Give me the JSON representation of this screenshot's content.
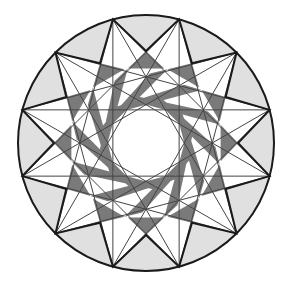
{
  "figure": {
    "center": [
      146,
      143
    ],
    "outer_radius": 128,
    "valley_radius": 92,
    "points": 12,
    "start_angle_deg": 15,
    "chord_steps": [
      4,
      5
    ],
    "colors": {
      "background": "#ffffff",
      "outline": "#1a1a1a",
      "chord": "#444444",
      "light_fill": "#e0e0e0",
      "dark_fill": "#7a7a7a"
    }
  }
}
